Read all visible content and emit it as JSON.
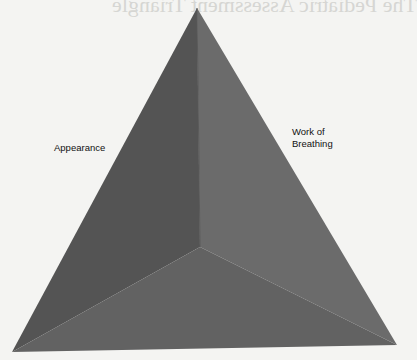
{
  "diagram": {
    "title": "The Pediatric Assessment Triangle",
    "labels": {
      "appearance": "Appearance",
      "work_of_breathing_line1": "Work of",
      "work_of_breathing_line2": "Breathing"
    },
    "colors": {
      "background": "#f4f4f2",
      "left_face": "#545454",
      "right_face": "#6b6b6b",
      "bottom_face": "#626262",
      "label_text": "#111111"
    }
  }
}
